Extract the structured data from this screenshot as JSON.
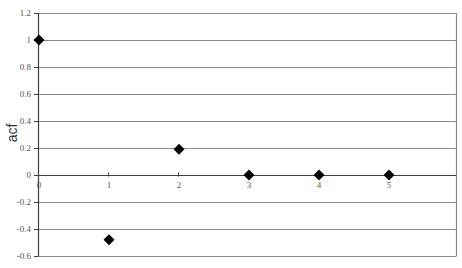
{
  "chart_data": {
    "type": "scatter",
    "title": "",
    "xlabel": "",
    "ylabel": "acf",
    "x": [
      0,
      1,
      2,
      3,
      4,
      5
    ],
    "series": [
      {
        "name": "acf",
        "values": [
          1.0,
          -0.48,
          0.19,
          0.0,
          0.0,
          0.0
        ],
        "marker": "diamond",
        "color": "#000000"
      }
    ],
    "xlim": [
      0,
      5
    ],
    "ylim": [
      -0.6,
      1.2
    ],
    "yticks": [
      1.2,
      1,
      0.8,
      0.6,
      0.4,
      0.2,
      0,
      -0.2,
      -0.4,
      -0.6
    ],
    "ytick_labels": [
      "1.2",
      "1",
      "0.8",
      "0.6",
      "0.4",
      "0.2",
      "0",
      "-0.2",
      "-0.4",
      "-0.6"
    ],
    "xticks": [
      0,
      1,
      2,
      3,
      4,
      5
    ],
    "xtick_labels": [
      "0",
      "1",
      "2",
      "3",
      "4",
      "5"
    ],
    "grid": {
      "horizontal": true,
      "vertical": false,
      "color": "#808080"
    },
    "legend": null
  },
  "layout": {
    "plot_left": 38,
    "plot_right": 456,
    "plot_top": 13,
    "plot_bottom": 256,
    "x_px_per_unit": 70,
    "axis_color": "#404040",
    "grid_color": "#8a8a8a",
    "marker_size": 11
  }
}
